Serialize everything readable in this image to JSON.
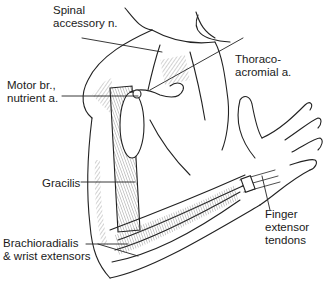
{
  "figure": {
    "type": "anatomical illustration"
  },
  "labels": {
    "spinal_accessory": [
      "Spinal",
      "accessory n."
    ],
    "thoracoacromial": [
      "Thoraco-",
      "acromial a."
    ],
    "motor_branch": [
      "Motor br.,",
      "nutrient a."
    ],
    "gracilis": [
      "Gracilis"
    ],
    "brachioradialis": [
      "Brachioradialis",
      "& wrist extensors"
    ],
    "finger_extensor": [
      "Finger",
      "extensor",
      "tendons"
    ]
  },
  "colors": {
    "line": "#222222",
    "hatch": "#555555",
    "background": "#ffffff"
  }
}
